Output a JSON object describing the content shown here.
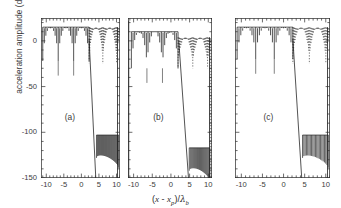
{
  "figure": {
    "background": "#ffffff",
    "ink": "#1a1a1a",
    "axis_color": "#2b2b2b"
  },
  "axes": {
    "ylabel": "acceleration amplitude (dB)",
    "xlabel_plain": "(x - xp)/λb",
    "xlabel_parts": {
      "open": "(",
      "x": "x",
      "minus": " - ",
      "xp_base": "x",
      "xp_sub": "p",
      "close": ")/",
      "lambda": "λ",
      "lambda_sub": "b"
    }
  },
  "chart_data": {
    "type": "line",
    "title": "",
    "xlabel": "(x - x_p)/λ_b",
    "ylabel": "acceleration amplitude (dB)",
    "xlim": [
      -11.5,
      11.0
    ],
    "ylim": [
      -150,
      25
    ],
    "xticks": [
      -10,
      -5,
      0,
      5,
      10
    ],
    "xticklabels": [
      "-10",
      "-5",
      "0",
      "5",
      "10"
    ],
    "yticks": [
      0,
      -50,
      -100,
      -150
    ],
    "yticklabels": [
      "0",
      "-50",
      "-100",
      "-150"
    ],
    "grid": false,
    "legend": false,
    "minor_ticks": true,
    "panels": [
      {
        "label": "(a)",
        "plateau_top_db": 15,
        "plateau_x_range": [
          -11.0,
          2.2
        ],
        "lobe_floor_db": -22,
        "n_spikes_left": 30,
        "envelope_lobes": 3,
        "dotted_region_x_range": [
          2.2,
          10.8
        ],
        "dotted_top_db": 15,
        "dotted_floor_db": -25,
        "descent_line": {
          "x0": 2.2,
          "y0": 2,
          "x1": 4.1,
          "y1": -150
        },
        "lower_cluster": {
          "x_range": [
            4.3,
            10.6
          ],
          "top_db": -103,
          "floor_db": -128,
          "n_spikes": 22
        },
        "right_edge_spike_db": -150
      },
      {
        "label": "(b)",
        "plateau_top_db": 10,
        "plateau_x_range": [
          -10.6,
          1.9
        ],
        "lobe_floor_db": -30,
        "n_spikes_left": 28,
        "envelope_lobes": 3,
        "dotted_region_x_range": [
          1.9,
          10.6
        ],
        "dotted_top_db": 4,
        "dotted_floor_db": -30,
        "descent_line": {
          "x0": 2.1,
          "y0": 0,
          "x1": 4.7,
          "y1": -150
        },
        "lower_cluster": {
          "x_range": [
            4.9,
            10.4
          ],
          "top_db": -117,
          "floor_db": -142,
          "n_spikes": 20
        },
        "left_edge_line": {
          "x": -11.3,
          "y_top": 22,
          "y_bottom": -150
        },
        "right_edge_dotted": {
          "x": 10.7,
          "y_top": 0,
          "y_bottom": -150
        },
        "right_edge_spike_db": -150
      },
      {
        "label": "(c)",
        "plateau_top_db": 15,
        "plateau_x_range": [
          -11.0,
          2.2
        ],
        "lobe_floor_db": -20,
        "n_spikes_left": 30,
        "envelope_lobes": 3,
        "dotted_region_x_range": [
          2.2,
          10.8
        ],
        "dotted_top_db": 15,
        "dotted_floor_db": -25,
        "descent_line": {
          "x0": 2.2,
          "y0": 2,
          "x1": 4.3,
          "y1": -150
        },
        "lower_cluster": {
          "x_range": [
            4.5,
            10.6
          ],
          "top_db": -103,
          "floor_db": -128,
          "n_spikes": 20
        },
        "right_edge_spike_db": -150
      }
    ]
  }
}
